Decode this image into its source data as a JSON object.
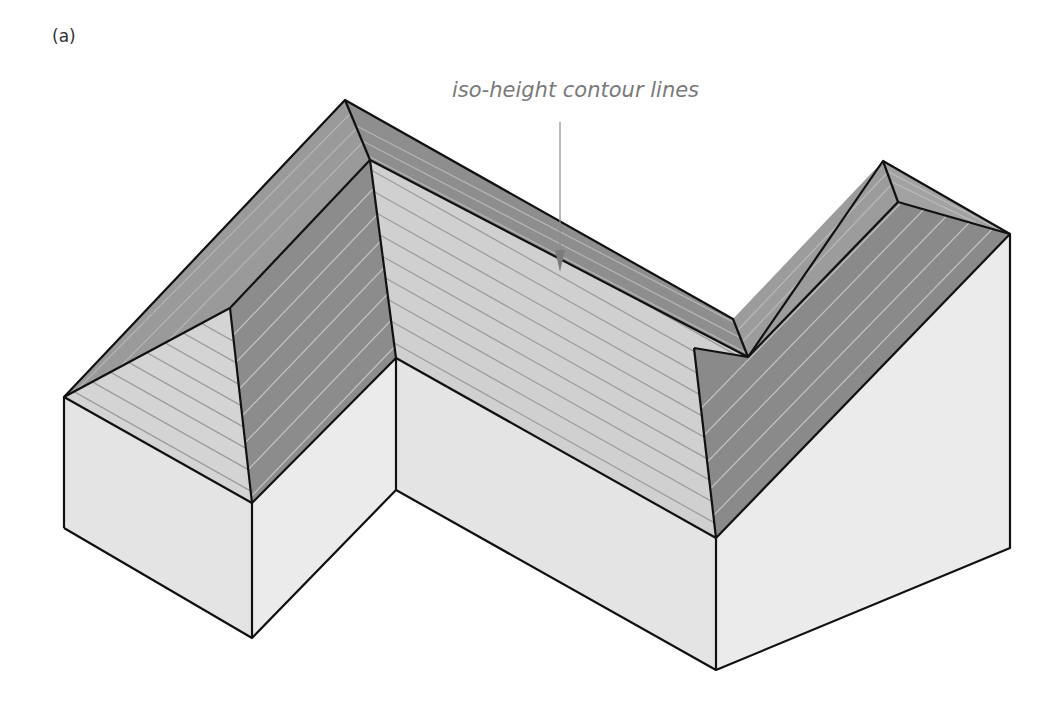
{
  "figure": {
    "panel_label": "(a)",
    "annotation": {
      "text": "iso-height contour lines",
      "arrow_color": "#8a8a8a"
    },
    "colors": {
      "background": "#ffffff",
      "outline": "#111111",
      "wall_face": "#e6e6e6",
      "roof_light": "#d2d2d2",
      "roof_dark": "#8c8c8c",
      "roof_mid": "#a0a0a0",
      "contour_line_on_light": "#9a9a9a",
      "contour_line_on_dark": "#c8c8c8",
      "annotation_text": "#7a7a7a"
    }
  }
}
